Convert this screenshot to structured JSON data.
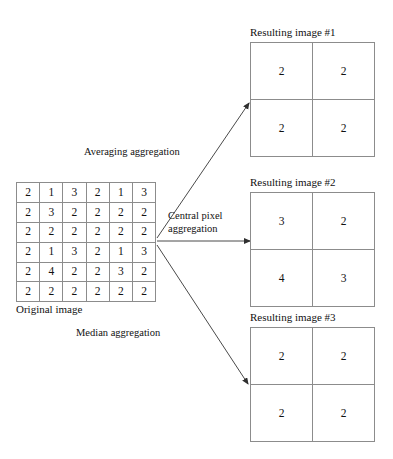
{
  "diagram": {
    "source": {
      "caption": "Original image",
      "rows": [
        [
          "2",
          "1",
          "3",
          "2",
          "1",
          "3"
        ],
        [
          "2",
          "3",
          "2",
          "2",
          "2",
          "2"
        ],
        [
          "2",
          "2",
          "2",
          "2",
          "2",
          "2"
        ],
        [
          "2",
          "1",
          "3",
          "2",
          "1",
          "3"
        ],
        [
          "2",
          "4",
          "2",
          "2",
          "3",
          "2"
        ],
        [
          "2",
          "2",
          "2",
          "2",
          "2",
          "2"
        ]
      ]
    },
    "arrows": [
      {
        "label": "Averaging aggregation",
        "target": "Resulting image #1"
      },
      {
        "label": "Central pixel\naggregation",
        "target": "Resulting image #2"
      },
      {
        "label": "Median aggregation",
        "target": "Resulting image #3"
      }
    ],
    "results": [
      {
        "title": "Resulting image #1",
        "rows": [
          [
            "2",
            "2"
          ],
          [
            "2",
            "2"
          ]
        ]
      },
      {
        "title": "Resulting image #2",
        "rows": [
          [
            "3",
            "2"
          ],
          [
            "4",
            "3"
          ]
        ]
      },
      {
        "title": "Resulting image #3",
        "rows": [
          [
            "2",
            "2"
          ],
          [
            "2",
            "2"
          ]
        ]
      }
    ],
    "colors": {
      "grid_line": "#8c8c8c",
      "text": "#111111",
      "arrow": "#3a3a3a",
      "background": "#ffffff"
    }
  }
}
